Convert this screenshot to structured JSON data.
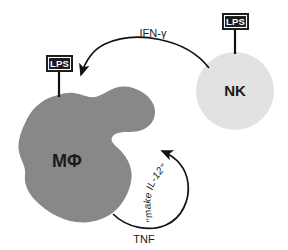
{
  "figure": {
    "background_color": "#ffffff"
  },
  "cells": {
    "macrophage": {
      "label": "MΦ",
      "fill_color": "#888888",
      "kind": "amoeboid-blob"
    },
    "nk_cell": {
      "label": "NK",
      "fill_color": "#e2e2e2",
      "kind": "circle"
    }
  },
  "stimuli": [
    {
      "name": "lps-macrophage",
      "label": "LPS",
      "box_color": "#1a1a1a",
      "text_color": "#ffffff"
    },
    {
      "name": "lps-nk",
      "label": "LPS",
      "box_color": "#1a1a1a",
      "text_color": "#ffffff"
    }
  ],
  "signals": {
    "ifn_gamma": {
      "label": "IFN-γ",
      "direction": "NK to macrophage",
      "stroke_color": "#111111"
    },
    "tnf": {
      "label": "TNF",
      "direction": "macrophage feedback loop",
      "stroke_color": "#111111"
    },
    "make_il12": {
      "label": "\"make IL-12\"",
      "letters": [
        "\"",
        "m",
        "a",
        "k",
        "e",
        " ",
        "I",
        "L",
        "-",
        "1",
        "2",
        "\""
      ],
      "style": "italic-curved",
      "stroke_color": "#111111"
    }
  }
}
